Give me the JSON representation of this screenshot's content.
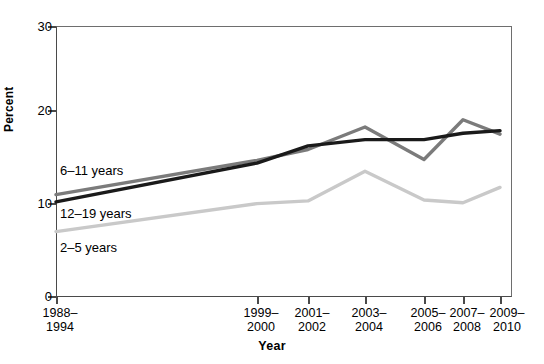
{
  "chart_data": {
    "type": "line",
    "title": "",
    "xlabel": "Year",
    "ylabel": "Percent",
    "ylim": [
      0,
      30
    ],
    "yticks": [
      0,
      10,
      20,
      30
    ],
    "grid": false,
    "legend_position": "inline-left",
    "categories": [
      "1988–\n1994",
      "1999–\n2000",
      "2001–\n2002",
      "2003–\n2004",
      "2005–\n2006",
      "2007–\n2008",
      "2009–\n2010"
    ],
    "series": [
      {
        "name": "6–11 years",
        "color": "#7b7b7b",
        "values": [
          11.3,
          15.1,
          16.3,
          18.8,
          15.2,
          19.6,
          18.0
        ]
      },
      {
        "name": "12–19 years",
        "color": "#1a1a1a",
        "values": [
          10.5,
          14.8,
          16.7,
          17.4,
          17.4,
          18.1,
          18.4
        ]
      },
      {
        "name": "2–5 years",
        "color": "#c9c9c9",
        "values": [
          7.2,
          10.3,
          10.6,
          13.9,
          10.7,
          10.4,
          12.1
        ]
      }
    ]
  },
  "axes": {
    "y_tick_labels": [
      "30",
      "20",
      "10",
      "0"
    ],
    "y_title": "Percent",
    "x_title": "Year",
    "x_tick_labels": [
      "1988–\n1994",
      "1999–\n2000",
      "2001–\n2002",
      "2003–\n2004",
      "2005–\n2006",
      "2007–\n2008",
      "2009–\n2010"
    ]
  },
  "series_labels": {
    "s0": "6–11 years",
    "s1": "12–19 years",
    "s2": "2–5 years"
  }
}
